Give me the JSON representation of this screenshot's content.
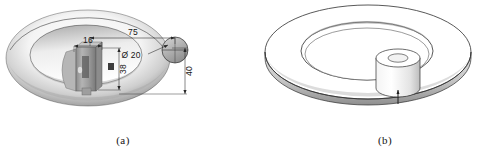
{
  "figure": {
    "background_color": "#ffffff",
    "panels": [
      {
        "id": "a",
        "caption": "(a)",
        "description": "shaded 3D ring with overlaid dimensioned component",
        "dimensions": [
          {
            "name": "overall-length",
            "label": "75",
            "orientation": "horizontal",
            "position": "top"
          },
          {
            "name": "width",
            "label": "16",
            "orientation": "horizontal",
            "position": "upper-left"
          },
          {
            "name": "boss-diameter",
            "label": "Ø 20",
            "orientation": "leader",
            "position": "upper-right"
          },
          {
            "name": "height-inner",
            "label": "38",
            "orientation": "vertical",
            "position": "center-right"
          },
          {
            "name": "height-outer",
            "label": "40",
            "orientation": "vertical",
            "position": "far-right"
          }
        ]
      },
      {
        "id": "b",
        "caption": "(b)",
        "description": "line-art 3D annular disc with central cylindrical boss",
        "dimensions": []
      }
    ]
  },
  "colors": {
    "line": "#2b2b2b",
    "dimension": "#272727",
    "shade_light": "#f2f2f2",
    "shade_mid": "#c9c9c9",
    "shade_dark": "#8e8e8e",
    "part_body": "#9a9a9a",
    "part_dark": "#6a6a6a"
  }
}
